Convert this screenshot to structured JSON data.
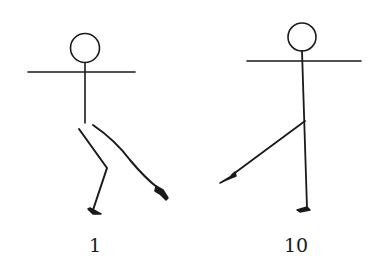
{
  "figures": [
    {
      "id": "figure-1",
      "label": "1",
      "description": "stick figure with arms outstretched, standing leg bent, other leg extended diagonally to the side on floor"
    },
    {
      "id": "figure-10",
      "label": "10",
      "description": "stick figure with arms outstretched, straight standing leg, other leg lifted and extended to the side"
    }
  ],
  "colors": {
    "stroke": "#1a1a1a",
    "background": "#ffffff"
  }
}
